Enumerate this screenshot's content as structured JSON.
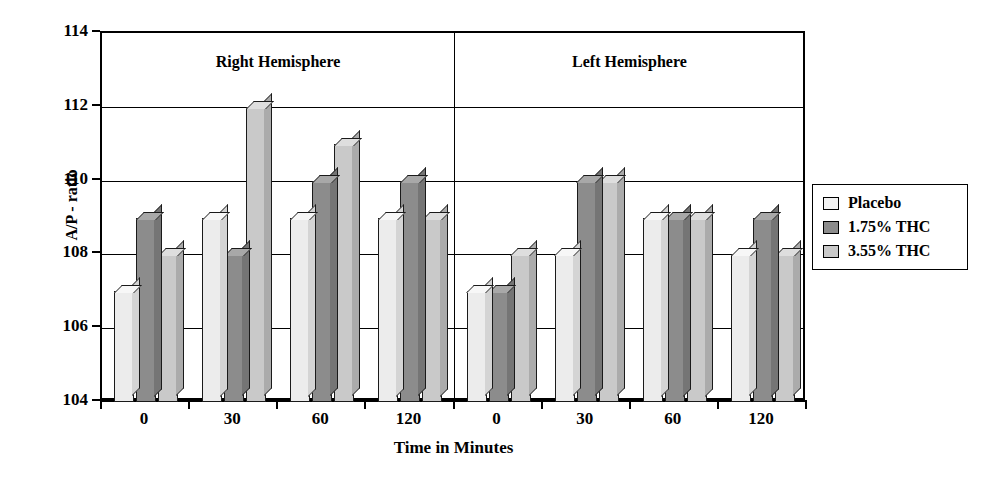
{
  "chart_data": {
    "type": "bar",
    "title": "",
    "xlabel": "Time in Minutes",
    "ylabel": "A/P - ratio",
    "ylim": [
      104,
      114
    ],
    "ytick_step": 2,
    "yticks": [
      104,
      106,
      108,
      110,
      112,
      114
    ],
    "grid": true,
    "legend_position": "right",
    "panels": [
      {
        "label": "Right Hemisphere",
        "categories": [
          "0",
          "30",
          "60",
          "120"
        ]
      },
      {
        "label": "Left Hemisphere",
        "categories": [
          "0",
          "30",
          "60",
          "120"
        ]
      }
    ],
    "categories": [
      "0",
      "30",
      "60",
      "120",
      "0",
      "30",
      "60",
      "120"
    ],
    "series": [
      {
        "name": "Placebo",
        "values": [
          107,
          109,
          109,
          109,
          107,
          108,
          109,
          108
        ]
      },
      {
        "name": "1.75% THC",
        "values": [
          109,
          108,
          110,
          110,
          107,
          110,
          109,
          109
        ]
      },
      {
        "name": "3.55% THC",
        "values": [
          108,
          112,
          111,
          109,
          108,
          110,
          109,
          108
        ]
      }
    ]
  },
  "axes": {
    "y_title": "A/P - ratio",
    "y_labels": [
      "114",
      "112",
      "110",
      "108",
      "106",
      "104"
    ],
    "x_title": "Time in Minutes",
    "x_labels": [
      "0",
      "30",
      "60",
      "120",
      "0",
      "30",
      "60",
      "120"
    ]
  },
  "panels": {
    "right_title": "Right Hemisphere",
    "left_title": "Left Hemisphere"
  },
  "legend": {
    "items": [
      {
        "label": "Placebo",
        "color": "#f2f2f2"
      },
      {
        "label": "1.75% THC",
        "color": "#8c8c8c"
      },
      {
        "label": "3.55% THC",
        "color": "#c9c9c9"
      }
    ]
  }
}
